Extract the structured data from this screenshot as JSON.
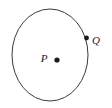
{
  "figure": {
    "type": "geometry-diagram",
    "background_color": "#ffffff",
    "stroke_color": "#3a3a3a",
    "label_color": "#1a1a1a",
    "point_color": "#1a1a1a",
    "circle": {
      "name": "circle-P",
      "center_x": 50,
      "center_y": 55,
      "radius_x": 38,
      "radius_y": 46,
      "stroke_width": 1
    },
    "points": [
      {
        "id": "center-point",
        "label": "P",
        "x": 57,
        "y": 60,
        "dot_radius": 2.6,
        "label_x": 44,
        "label_y": 62
      },
      {
        "id": "circumference-point",
        "label": "Q",
        "x": 86.5,
        "y": 38,
        "dot_radius": 2.4,
        "label_x": 92,
        "label_y": 44
      }
    ]
  }
}
